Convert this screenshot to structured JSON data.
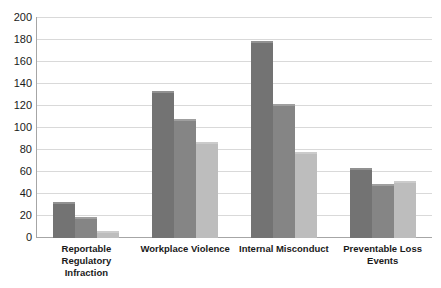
{
  "chart_data": {
    "type": "bar",
    "title": "",
    "subtitle": "",
    "xlabel": "",
    "ylabel": "",
    "ylim": [
      0,
      200
    ],
    "yticks": [
      0,
      20,
      40,
      60,
      80,
      100,
      120,
      140,
      160,
      180,
      200
    ],
    "ytick_labels": [
      "0",
      "20",
      "40",
      "60",
      "80",
      "100",
      "120",
      "140",
      "160",
      "180",
      "200"
    ],
    "grid": true,
    "grid_axis": "y",
    "legend": false,
    "legend_position": "none",
    "categories": [
      "Reportable Regulatory Infraction",
      "Workplace Violence",
      "Internal Misconduct",
      "Preventable Loss Events"
    ],
    "category_lines": [
      [
        "Reportable Regulatory",
        "Infraction"
      ],
      [
        "Workplace Violence"
      ],
      [
        "Internal Misconduct"
      ],
      [
        "Preventable Loss Events"
      ]
    ],
    "series": [
      {
        "name": "Series 1",
        "color": "#737373",
        "values": [
          33,
          134,
          179,
          64
        ]
      },
      {
        "name": "Series 2",
        "color": "#858585",
        "values": [
          19,
          108,
          122,
          49
        ]
      },
      {
        "name": "Series 3",
        "color": "#bdbdbd",
        "values": [
          6,
          87,
          78,
          52
        ]
      }
    ],
    "colors": {
      "series_1": "#737373",
      "series_2": "#858585",
      "series_3": "#bdbdbd",
      "gridline": "#d9d9d9",
      "axis": "#a6a6a6",
      "text": "#1a1a1a",
      "background": "#ffffff"
    }
  }
}
